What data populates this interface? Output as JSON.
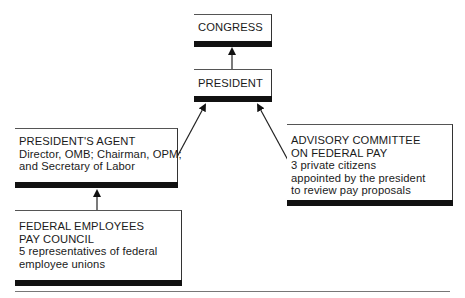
{
  "diagram": {
    "type": "organization-flow",
    "nodes": [
      {
        "id": "congress",
        "lines": [
          "CONGRESS"
        ]
      },
      {
        "id": "president",
        "lines": [
          "PRESIDENT"
        ]
      },
      {
        "id": "presidents_agent",
        "lines": [
          "PRESIDENT'S AGENT",
          "Director, OMB; Chairman, OPM;",
          "and Secretary of Labor"
        ]
      },
      {
        "id": "advisory_committee",
        "lines": [
          "ADVISORY COMMITTEE",
          "ON FEDERAL PAY",
          "3 private citizens",
          "appointed by the president",
          "to review pay proposals"
        ]
      },
      {
        "id": "federal_employees_pay_council",
        "lines": [
          "FEDERAL EMPLOYEES",
          "PAY COUNCIL",
          "5 representatives of federal",
          "employee unions"
        ]
      }
    ],
    "edges": [
      {
        "from": "president",
        "to": "congress"
      },
      {
        "from": "presidents_agent",
        "to": "president"
      },
      {
        "from": "advisory_committee",
        "to": "president"
      },
      {
        "from": "federal_employees_pay_council",
        "to": "presidents_agent"
      }
    ],
    "colors": {
      "bar": "#111111",
      "line": "#333333",
      "background": "#ffffff"
    }
  }
}
